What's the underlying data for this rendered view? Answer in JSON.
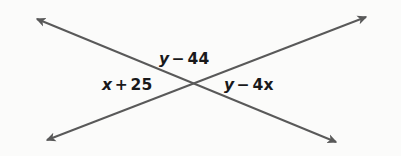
{
  "figure": {
    "name": "intersecting-lines-angle-diagram",
    "background_color": "#fbfbfa",
    "line_color": "#595959",
    "text_color": "#19191b",
    "intersection": {
      "x": 194,
      "y": 85
    }
  },
  "labels": {
    "top": {
      "full_text": "y − 44",
      "variable": "y",
      "operator": "−",
      "term": "44"
    },
    "left": {
      "full_text": "x + 25",
      "variable": "x",
      "operator": "+",
      "term": "25"
    },
    "right": {
      "full_text": "y − 4x",
      "variable": "y",
      "operator": "−",
      "term": "4x"
    }
  },
  "lines": [
    {
      "id": "line-nw-se",
      "description": "line from upper-left to lower-right",
      "start": {
        "x": 34,
        "y": 17
      },
      "end": {
        "x": 338,
        "y": 143
      },
      "arrow_start": "arrowhead-up-left",
      "arrow_end": "arrowhead-down-right"
    },
    {
      "id": "line-sw-ne",
      "description": "line from lower-left to upper-right",
      "start": {
        "x": 44,
        "y": 142
      },
      "end": {
        "x": 369,
        "y": 15
      },
      "arrow_start": "arrowhead-down-left",
      "arrow_end": "arrowhead-up-right"
    }
  ]
}
